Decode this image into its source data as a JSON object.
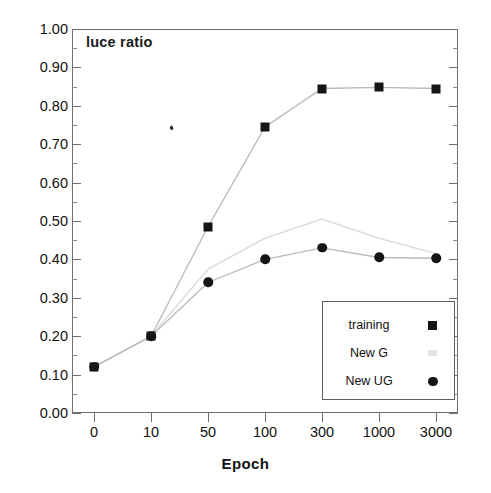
{
  "chart_data": {
    "type": "line",
    "title": "luce ratio",
    "xlabel": "Epoch",
    "ylabel": "",
    "categories": [
      "0",
      "10",
      "50",
      "100",
      "300",
      "1000",
      "3000"
    ],
    "ylim": [
      0.0,
      1.0
    ],
    "y_tick_step": 0.1,
    "y_minor_step": 0.05,
    "grid": false,
    "legend_position": "lower-right-inside",
    "x_scale": "categorical",
    "y_ticks": [
      "0.00",
      "0.10",
      "0.20",
      "0.30",
      "0.40",
      "0.50",
      "0.60",
      "0.70",
      "0.80",
      "0.90",
      "1.00"
    ],
    "series": [
      {
        "name": "training",
        "marker": "filled-square",
        "color": "#151515",
        "values": [
          0.12,
          0.2,
          0.485,
          0.745,
          0.845,
          0.848,
          0.845
        ]
      },
      {
        "name": "New G",
        "marker": "none",
        "color": "#d8d8d5",
        "values": [
          0.12,
          0.2,
          0.375,
          0.455,
          0.505,
          0.455,
          0.415
        ]
      },
      {
        "name": "New UG",
        "marker": "filled-circle",
        "color": "#151515",
        "values": [
          0.12,
          0.2,
          0.34,
          0.4,
          0.43,
          0.405,
          0.403
        ]
      }
    ]
  },
  "figure": {
    "background": "#ffffff",
    "frame_color": "#6f6f6f",
    "tick_color": "#6f6f6f"
  },
  "legend": {
    "entries": [
      {
        "label": "training",
        "marker": "filled-square"
      },
      {
        "label": "New G",
        "marker": "faded-marker"
      },
      {
        "label": "New UG",
        "marker": "filled-circle"
      }
    ]
  }
}
